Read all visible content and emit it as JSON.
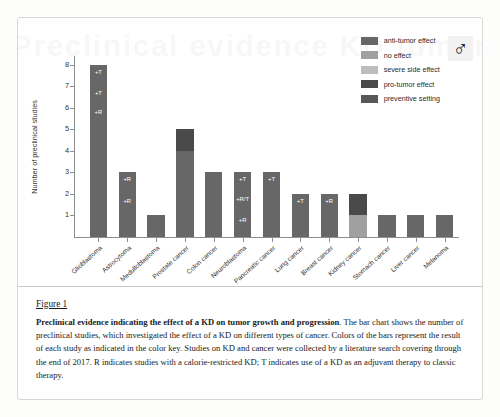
{
  "watermark_text": "Preclinical evidence KD tumor",
  "badge": {
    "icon": "mars-symbol-icon",
    "glyph": "♂"
  },
  "legend": {
    "items": [
      {
        "label": "anti-tumor effect",
        "color": "#676767"
      },
      {
        "label": "no effect",
        "color": "#a0a0a0"
      },
      {
        "label": "severe side effect",
        "color": "#bdbdbd"
      },
      {
        "label": "pro-tumor effect",
        "color": "#4a4a4a"
      },
      {
        "label": "preventive setting",
        "color": "#585858"
      }
    ]
  },
  "chart_data": {
    "type": "bar",
    "title": "",
    "xlabel": "",
    "ylabel": "Number of preclinical studies",
    "ylim": [
      0,
      8.4
    ],
    "yticks": [
      1,
      2,
      3,
      4,
      5,
      6,
      7,
      8
    ],
    "grid": false,
    "legend_position": "top-right",
    "stacked": true,
    "categories": [
      "Glioblastoma",
      "Astrocytoma",
      "Medulloblastoma",
      "Prostate cancer",
      "Colon cancer",
      "Neuroblastoma",
      "Pancreatic cancer",
      "Lung cancer",
      "Breast cancer",
      "Kidney cancer",
      "Stomach cancer",
      "Liver cancer",
      "Melanoma"
    ],
    "values": [
      8,
      3,
      1,
      5,
      3,
      3,
      3,
      2,
      2,
      2,
      1,
      1,
      1
    ],
    "series": [
      {
        "name": "anti-tumor effect",
        "values": [
          8,
          3,
          1,
          4,
          3,
          3,
          3,
          2,
          2,
          1,
          1,
          1,
          1
        ]
      },
      {
        "name": "no effect",
        "values": [
          0,
          0,
          0,
          0,
          0,
          0,
          0,
          0,
          0,
          0,
          0,
          0,
          0
        ]
      },
      {
        "name": "severe side effect",
        "values": [
          0,
          0,
          0,
          0,
          0,
          0,
          0,
          0,
          0,
          0,
          0,
          0,
          0
        ]
      },
      {
        "name": "pro-tumor effect",
        "values": [
          0,
          0,
          0,
          1,
          0,
          0,
          0,
          0,
          0,
          1,
          0,
          0,
          0
        ]
      },
      {
        "name": "preventive setting",
        "values": [
          0,
          0,
          0,
          0,
          0,
          0,
          0,
          0,
          0,
          0,
          0,
          0,
          0
        ]
      }
    ],
    "bars": [
      {
        "category": "Glioblastoma",
        "total": 8,
        "segments": [
          {
            "value": 8,
            "color": "#676767"
          }
        ],
        "annotations": [
          {
            "text": "+T",
            "at": 7.5
          },
          {
            "text": "+T",
            "at": 6.5
          },
          {
            "text": "+R",
            "at": 5.6
          }
        ]
      },
      {
        "category": "Astrocytoma",
        "total": 3,
        "segments": [
          {
            "value": 3,
            "color": "#676767"
          }
        ],
        "annotations": [
          {
            "text": "+R",
            "at": 2.5
          },
          {
            "text": "+R",
            "at": 1.5
          }
        ]
      },
      {
        "category": "Medulloblastoma",
        "total": 1,
        "segments": [
          {
            "value": 1,
            "color": "#676767"
          }
        ],
        "annotations": []
      },
      {
        "category": "Prostate cancer",
        "total": 5,
        "segments": [
          {
            "value": 4,
            "color": "#676767"
          },
          {
            "value": 1,
            "color": "#4a4a4a"
          }
        ],
        "annotations": []
      },
      {
        "category": "Colon cancer",
        "total": 3,
        "segments": [
          {
            "value": 3,
            "color": "#676767"
          }
        ],
        "annotations": []
      },
      {
        "category": "Neuroblastoma",
        "total": 3,
        "segments": [
          {
            "value": 3,
            "color": "#676767"
          }
        ],
        "annotations": [
          {
            "text": "+T",
            "at": 2.5
          },
          {
            "text": "+R/T",
            "at": 1.6
          },
          {
            "text": "+R",
            "at": 0.6
          }
        ]
      },
      {
        "category": "Pancreatic cancer",
        "total": 3,
        "segments": [
          {
            "value": 3,
            "color": "#676767"
          }
        ],
        "annotations": [
          {
            "text": "+T",
            "at": 2.5
          }
        ]
      },
      {
        "category": "Lung cancer",
        "total": 2,
        "segments": [
          {
            "value": 2,
            "color": "#676767"
          }
        ],
        "annotations": [
          {
            "text": "+T",
            "at": 1.5
          }
        ]
      },
      {
        "category": "Breast cancer",
        "total": 2,
        "segments": [
          {
            "value": 2,
            "color": "#676767"
          }
        ],
        "annotations": [
          {
            "text": "+R",
            "at": 1.5
          }
        ]
      },
      {
        "category": "Kidney cancer",
        "total": 2,
        "segments": [
          {
            "value": 1,
            "color": "#a0a0a0"
          },
          {
            "value": 1,
            "color": "#4a4a4a"
          }
        ],
        "annotations": []
      },
      {
        "category": "Stomach cancer",
        "total": 1,
        "segments": [
          {
            "value": 1,
            "color": "#676767"
          }
        ],
        "annotations": []
      },
      {
        "category": "Liver cancer",
        "total": 1,
        "segments": [
          {
            "value": 1,
            "color": "#676767"
          }
        ],
        "annotations": []
      },
      {
        "category": "Melanoma",
        "total": 1,
        "segments": [
          {
            "value": 1,
            "color": "#676767"
          }
        ],
        "annotations": []
      }
    ]
  },
  "caption": {
    "figure_number": "Figure 1",
    "bold_lead": "Preclinical evidence indicating the effect of a KD on tumor growth and progression",
    "body": ". The bar chart shows the number of preclinical studies, which investigated the effect of a KD on different types of cancer. Colors of the bars represent the result of each study as indicated in the color key. Studies on KD and cancer were collected by a literature search covering through the end of 2017. R indicates studies with a calorie-restricted KD; T indicates use of a KD as an adjuvant therapy to classic therapy."
  }
}
